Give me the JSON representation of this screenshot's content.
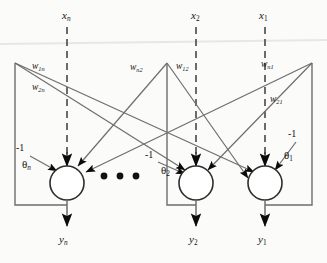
{
  "figure": {
    "type": "neural-network-diagram",
    "colors": {
      "background": "#fbfbfa",
      "stroke": "#4a4a4a",
      "dashed_stroke": "#3d3d3d",
      "text": "#16140f",
      "arrow_fill": "#0b0b0b"
    }
  },
  "inputs": [
    {
      "id": "x_n",
      "base": "x",
      "sub": "n",
      "x": 68,
      "y": 16
    },
    {
      "id": "x_2",
      "base": "x",
      "sub": "2",
      "x": 197,
      "y": 16
    },
    {
      "id": "x_1",
      "base": "x",
      "sub": "1",
      "x": 265,
      "y": 16
    }
  ],
  "weights": [
    {
      "id": "w_1n",
      "base": "w",
      "sub": "1n",
      "x": 36,
      "y": 66
    },
    {
      "id": "w_2n",
      "base": "w",
      "sub": "2n",
      "x": 36,
      "y": 86
    },
    {
      "id": "w_n2",
      "base": "w",
      "sub": "n2",
      "x": 132,
      "y": 66
    },
    {
      "id": "w_12",
      "base": "w",
      "sub": "12",
      "x": 178,
      "y": 66
    },
    {
      "id": "w_n1",
      "base": "w",
      "sub": "n1",
      "x": 262,
      "y": 64
    },
    {
      "id": "w_21",
      "base": "w",
      "sub": "21",
      "x": 272,
      "y": 98
    }
  ],
  "biases": [
    {
      "id": "bias_n",
      "value": "-1",
      "x": 18,
      "y": 148
    },
    {
      "id": "bias_2",
      "value": "-1",
      "x": 146,
      "y": 155
    },
    {
      "id": "bias_1",
      "value": "-1",
      "x": 288,
      "y": 134
    }
  ],
  "thresholds": [
    {
      "id": "theta_n",
      "base": "θ",
      "sub": "n",
      "x": 26,
      "y": 164
    },
    {
      "id": "theta_2",
      "base": "θ",
      "sub": "2",
      "x": 165,
      "y": 170
    },
    {
      "id": "theta_1",
      "base": "θ",
      "sub": "1",
      "x": 286,
      "y": 156
    }
  ],
  "outputs": [
    {
      "id": "y_n",
      "base": "y",
      "sub": "n",
      "x": 61,
      "y": 238
    },
    {
      "id": "y_2",
      "base": "y",
      "sub": "2",
      "x": 191,
      "y": 238
    },
    {
      "id": "y_1",
      "base": "y",
      "sub": "1",
      "x": 260,
      "y": 238
    }
  ],
  "neurons": [
    {
      "id": "neuron_n",
      "cx": 67,
      "cy": 183,
      "r": 17
    },
    {
      "id": "neuron_2",
      "cx": 196,
      "cy": 183,
      "r": 17
    },
    {
      "id": "neuron_1",
      "cx": 265,
      "cy": 183,
      "r": 17
    }
  ],
  "ellipsis": {
    "id": "neuron-ellipsis",
    "dots": 3,
    "x": 104,
    "y": 176
  }
}
